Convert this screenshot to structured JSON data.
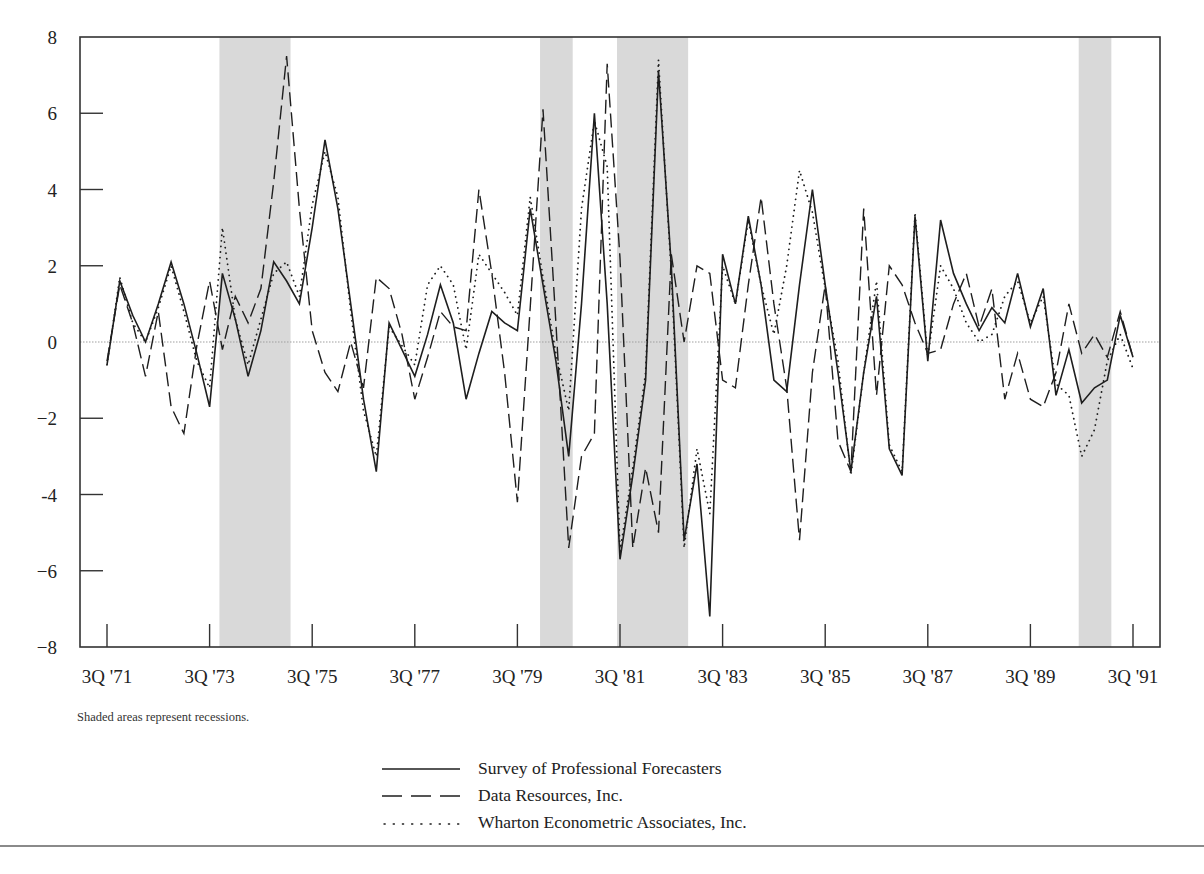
{
  "chart_data": {
    "type": "line",
    "title": "",
    "xlabel": "",
    "ylabel": "",
    "ylim": [
      -8,
      8
    ],
    "yticks": [
      8,
      6,
      4,
      2,
      0,
      -2,
      -4,
      -6,
      -8
    ],
    "ytick_labels": [
      "8",
      "6",
      "4",
      "2",
      "0",
      "−2",
      "-4",
      "−6",
      "−8"
    ],
    "xticks": [
      "3Q '71",
      "3Q '73",
      "3Q '75",
      "3Q '77",
      "3Q '79",
      "3Q '81",
      "3Q '83",
      "3Q '85",
      "3Q '87",
      "3Q '89",
      "3Q '91"
    ],
    "x_start": "3Q '71",
    "x_end": "3Q '91",
    "frequency": "quarterly",
    "zero_line": true,
    "grid": false,
    "legend_position": "bottom-center",
    "recessions": [
      {
        "start": "4Q '73",
        "end": "1Q '75"
      },
      {
        "start": "1Q '80",
        "end": "3Q '80"
      },
      {
        "start": "3Q '81",
        "end": "4Q '82"
      },
      {
        "start": "3Q '90",
        "end": "1Q '91"
      }
    ],
    "annotation": "Shaded areas represent recessions.",
    "series": [
      {
        "name": "Survey of Professional Forecasters",
        "style": "solid",
        "values": [
          -0.6,
          1.6,
          0.7,
          0.0,
          1.0,
          2.1,
          1.0,
          -0.3,
          -1.7,
          1.8,
          0.6,
          -0.9,
          0.3,
          2.1,
          1.6,
          1.0,
          3.0,
          5.3,
          3.5,
          1.0,
          -1.5,
          -3.4,
          0.5,
          -0.2,
          -0.9,
          0.2,
          1.5,
          0.5,
          -1.5,
          -0.3,
          0.8,
          0.5,
          0.3,
          3.5,
          1.5,
          -0.5,
          -3.0,
          1.0,
          6.0,
          1.0,
          -5.7,
          -3.5,
          -1.0,
          7.1,
          2.0,
          -5.2,
          -3.2,
          -7.2,
          2.3,
          1.0,
          3.3,
          1.5,
          -1.0,
          -1.3,
          1.5,
          4.0,
          1.5,
          -0.8,
          -3.4,
          -0.8,
          1.2,
          -2.8,
          -3.5,
          3.3,
          -0.5,
          3.2,
          1.8,
          1.0,
          0.3,
          0.9,
          0.5,
          1.8,
          0.4,
          1.4,
          -1.4,
          -0.2,
          -1.6,
          -1.2,
          -1.0,
          0.7,
          -0.4,
          0.3,
          -0.7,
          0.9,
          -0.4,
          1.0,
          -0.8,
          1.3,
          0.6,
          -0.6
        ],
        "values_plotted_count": 81
      },
      {
        "name": "Data Resources, Inc.",
        "style": "dashed",
        "values": [
          -0.5,
          1.5,
          0.5,
          -0.9,
          0.8,
          -1.7,
          -2.4,
          -0.1,
          1.6,
          -0.2,
          1.2,
          0.5,
          1.4,
          4.2,
          7.5,
          3.5,
          0.3,
          -0.8,
          -1.3,
          0.0,
          -1.2,
          1.7,
          1.4,
          0.2,
          -1.5,
          -0.4,
          0.8,
          0.4,
          0.3,
          4.0,
          1.8,
          -0.8,
          -4.2,
          0.9,
          6.1,
          0.5,
          -5.4,
          -3.0,
          -2.4,
          7.3,
          2.2,
          -5.4,
          -3.3,
          -5.0,
          2.3,
          0.0,
          2.0,
          1.8,
          -1.0,
          -1.2,
          1.5,
          3.8,
          1.0,
          -1.2,
          -5.2,
          -0.8,
          1.5,
          -2.6,
          -3.4,
          3.5,
          -1.4,
          2.0,
          1.5,
          0.5,
          -0.3,
          -0.2,
          1.0,
          1.8,
          0.4,
          1.4,
          -1.5,
          -0.3,
          -1.5,
          -1.7,
          -0.8,
          1.0,
          -0.3,
          0.2,
          -0.4,
          0.8,
          -0.4,
          2.0,
          -0.8,
          1.2,
          0.2,
          1.0
        ],
        "values_plotted_count": 81
      },
      {
        "name": "Wharton Econometric Associates, Inc.",
        "style": "dotted",
        "values": [
          -0.6,
          1.7,
          0.5,
          0.0,
          0.9,
          2.0,
          0.8,
          -0.5,
          -1.2,
          3.0,
          0.6,
          -0.6,
          0.6,
          1.8,
          2.1,
          1.2,
          3.6,
          5.0,
          3.8,
          0.8,
          -1.8,
          -3.0,
          0.4,
          -0.1,
          -0.6,
          1.5,
          2.0,
          1.5,
          -0.2,
          2.3,
          1.8,
          1.3,
          0.7,
          3.8,
          1.7,
          -0.3,
          -1.8,
          3.5,
          5.8,
          4.6,
          -5.5,
          -3.3,
          -0.8,
          7.4,
          1.8,
          -5.4,
          -2.8,
          -4.5,
          2.0,
          1.0,
          3.2,
          1.5,
          0.2,
          2.0,
          4.5,
          3.4,
          1.4,
          -0.5,
          -3.5,
          -0.8,
          1.6,
          -2.7,
          -3.4,
          3.4,
          -0.4,
          2.0,
          1.4,
          0.5,
          0.0,
          0.2,
          1.2,
          1.6,
          0.5,
          1.2,
          -1.1,
          -1.4,
          -3.0,
          -2.3,
          -0.5,
          0.2,
          -0.7,
          0.5,
          -0.6,
          0.3,
          -0.7,
          1.6,
          -2.8,
          3.8,
          1.0,
          1.0
        ],
        "values_plotted_count": 81
      }
    ]
  },
  "note": "Shaded areas represent recessions.",
  "legend": {
    "items": [
      {
        "label": "Survey of Professional Forecasters",
        "style": "solid"
      },
      {
        "label": "Data Resources, Inc.",
        "style": "dashed"
      },
      {
        "label": "Wharton Econometric Associates, Inc.",
        "style": "dotted"
      }
    ]
  },
  "colors": {
    "line": "#1e1e1e",
    "axis": "#333333",
    "recession_fill": "#d9d9d9",
    "zero_line": "#a0a0a0",
    "bottom_rule": "#8a8a8a"
  }
}
